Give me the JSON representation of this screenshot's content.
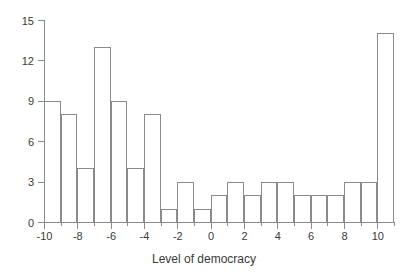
{
  "chart_data": {
    "type": "bar",
    "title": "",
    "subtitle": "",
    "xlabel": "Level of democracy",
    "ylabel": "",
    "xlim": [
      -10,
      11
    ],
    "ylim": [
      0,
      15
    ],
    "grid": false,
    "legend": null,
    "bin_width": 1,
    "bin_starts": [
      -10,
      -9,
      -8,
      -7,
      -6,
      -5,
      -4,
      -3,
      -2,
      -1,
      0,
      1,
      2,
      3,
      4,
      5,
      6,
      7,
      8,
      9,
      10
    ],
    "categories": [
      "-10 to -9",
      "-9 to -8",
      "-8 to -7",
      "-7 to -6",
      "-6 to -5",
      "-5 to -4",
      "-4 to -3",
      "-3 to -2",
      "-2 to -1",
      "-1 to 0",
      "0 to 1",
      "1 to 2",
      "2 to 3",
      "3 to 4",
      "4 to 5",
      "5 to 6",
      "6 to 7",
      "7 to 8",
      "8 to 9",
      "9 to 10",
      "10 to 11"
    ],
    "values": [
      9,
      8,
      4,
      13,
      9,
      4,
      8,
      1,
      3,
      1,
      2,
      3,
      2,
      3,
      3,
      2,
      2,
      2,
      3,
      3,
      14
    ],
    "x_ticks": [
      -10,
      -8,
      -6,
      -4,
      -2,
      0,
      2,
      4,
      6,
      8,
      10
    ],
    "x_tick_labels": [
      "-10",
      "-8",
      "-6",
      "-4",
      "-2",
      "0",
      "2",
      "4",
      "6",
      "8",
      "10"
    ],
    "x_minor_ticks": [
      -9,
      -7,
      -5,
      -3,
      -1,
      1,
      3,
      5,
      7,
      9,
      11
    ],
    "y_ticks": [
      0,
      3,
      6,
      9,
      12,
      15
    ],
    "y_tick_labels": [
      "0",
      "3",
      "6",
      "9",
      "12",
      "15"
    ],
    "colors": {
      "bar_edge": "#8a8a8a",
      "bar_fill": "transparent",
      "axis": "#8a8a8a",
      "text": "#3a3a3a",
      "background": "#ffffff"
    }
  }
}
